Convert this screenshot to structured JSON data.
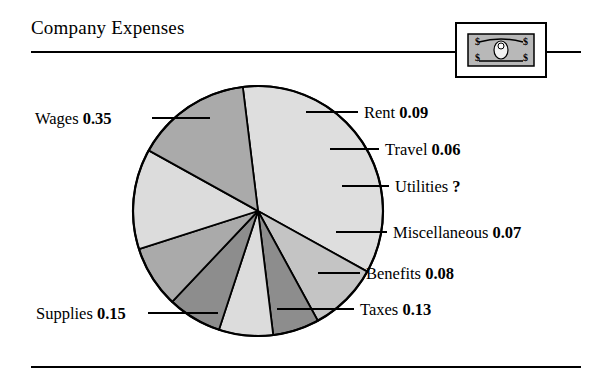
{
  "header": {
    "title": "Company Expenses",
    "badge_icon": "dollar-bill-icon"
  },
  "chart_data": {
    "type": "pie",
    "title": "Company Expenses",
    "xlabel": "",
    "ylabel": "",
    "legend_position": "callout-labels",
    "grid": false,
    "note": "Values are fractions of total; Utilities is unknown and shown as a question mark",
    "categories": [
      "Wages",
      "Rent",
      "Travel",
      "Utilities",
      "Miscellaneous",
      "Benefits",
      "Taxes",
      "Supplies"
    ],
    "values": [
      0.35,
      0.09,
      0.06,
      0.07,
      0.07,
      0.08,
      0.13,
      0.15
    ],
    "value_labels": [
      "0.35",
      "0.09",
      "0.06",
      "?",
      "0.07",
      "0.08",
      "0.13",
      "0.15"
    ],
    "slices": [
      {
        "name": "Wages",
        "value": 0.35,
        "value_label": "0.35",
        "label": "Wages 0.35",
        "color": "#dedede",
        "start_deg": -97,
        "end_deg": 29,
        "label_x": 35,
        "label_y": 124,
        "label_anchor": "start",
        "leader": [
          152,
          118,
          210,
          118
        ]
      },
      {
        "name": "Rent",
        "value": 0.09,
        "value_label": "0.09",
        "label": "Rent 0.09",
        "color": "#c4c4c4",
        "start_deg": 29,
        "end_deg": 61.4,
        "label_x": 364,
        "label_y": 118,
        "label_anchor": "start",
        "leader": [
          306,
          112,
          358,
          112
        ]
      },
      {
        "name": "Travel",
        "value": 0.06,
        "value_label": "0.06",
        "label": "Travel 0.06",
        "color": "#8d8d8d",
        "start_deg": 61.4,
        "end_deg": 83,
        "label_x": 385,
        "label_y": 155,
        "label_anchor": "start",
        "leader": [
          330,
          149,
          379,
          149
        ]
      },
      {
        "name": "Utilities",
        "value": 0.07,
        "value_label": "?",
        "label": "Utilities ?",
        "color": "#dcdcdc",
        "start_deg": 83,
        "end_deg": 108.2,
        "label_x": 395,
        "label_y": 192,
        "label_anchor": "start",
        "leader": [
          342,
          186,
          389,
          186
        ]
      },
      {
        "name": "Miscellaneous",
        "value": 0.07,
        "value_label": "0.07",
        "label": "Miscellaneous 0.07",
        "color": "#8d8d8d",
        "start_deg": 108.2,
        "end_deg": 133.4,
        "label_x": 393,
        "label_y": 238,
        "label_anchor": "start",
        "leader": [
          336,
          232,
          387,
          232
        ]
      },
      {
        "name": "Benefits",
        "value": 0.08,
        "value_label": "0.08",
        "label": "Benefits 0.08",
        "color": "#aaaaaa",
        "start_deg": 133.4,
        "end_deg": 162.2,
        "label_x": 366,
        "label_y": 279,
        "label_anchor": "start",
        "leader": [
          318,
          273,
          360,
          273
        ]
      },
      {
        "name": "Taxes",
        "value": 0.13,
        "value_label": "0.13",
        "label": "Taxes 0.13",
        "color": "#dcdcdc",
        "start_deg": 162.2,
        "end_deg": 209,
        "label_x": 360,
        "label_y": 315,
        "label_anchor": "start",
        "leader": [
          277,
          309,
          354,
          309
        ]
      },
      {
        "name": "Supplies",
        "value": 0.15,
        "value_label": "0.15",
        "label": "Supplies 0.15",
        "color": "#aaaaaa",
        "start_deg": 209,
        "end_deg": 263,
        "label_x": 36,
        "label_y": 319,
        "label_anchor": "start",
        "leader": [
          148,
          313,
          218,
          313
        ]
      }
    ],
    "geometry": {
      "cx": 258,
      "cy": 211,
      "r": 125
    },
    "colors": {
      "outline": "#000000",
      "background": "#ffffff",
      "light": "#dedede",
      "mid_light": "#c4c4c4",
      "mid": "#aaaaaa",
      "dark": "#8d8d8d"
    }
  }
}
